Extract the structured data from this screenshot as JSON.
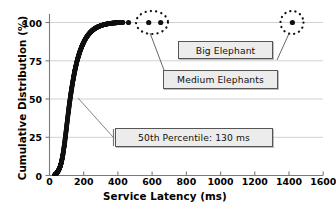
{
  "chart_data": {
    "type": "scatter",
    "title": "",
    "xlabel": "Service Latency (ms)",
    "ylabel": "Cumulative Distribution (%)",
    "xlim": [
      0,
      1600
    ],
    "ylim": [
      0,
      105
    ],
    "xticks": [
      0,
      200,
      400,
      600,
      800,
      1000,
      1200,
      1400,
      1600
    ],
    "yticks": [
      0,
      25,
      50,
      75,
      100
    ],
    "grid": "horizontal",
    "legend": "none",
    "series": [
      {
        "name": "Cumulative distribution of service latency",
        "marker": "filled-circle",
        "color": "#111111",
        "points": [
          [
            30,
            0.3
          ],
          [
            34,
            0.6
          ],
          [
            38,
            1.0
          ],
          [
            42,
            1.5
          ],
          [
            46,
            2.1
          ],
          [
            50,
            2.8
          ],
          [
            54,
            3.6
          ],
          [
            58,
            4.6
          ],
          [
            62,
            5.8
          ],
          [
            66,
            7.2
          ],
          [
            70,
            8.9
          ],
          [
            74,
            11.0
          ],
          [
            78,
            13.4
          ],
          [
            82,
            16.2
          ],
          [
            86,
            19.3
          ],
          [
            90,
            22.7
          ],
          [
            94,
            26.3
          ],
          [
            98,
            30.0
          ],
          [
            102,
            33.8
          ],
          [
            106,
            37.5
          ],
          [
            110,
            41.2
          ],
          [
            114,
            44.7
          ],
          [
            118,
            48.1
          ],
          [
            122,
            51.3
          ],
          [
            126,
            54.3
          ],
          [
            130,
            57.2
          ],
          [
            134,
            59.9
          ],
          [
            138,
            62.5
          ],
          [
            142,
            65.0
          ],
          [
            146,
            67.3
          ],
          [
            150,
            69.5
          ],
          [
            155,
            72.0
          ],
          [
            160,
            74.3
          ],
          [
            165,
            76.4
          ],
          [
            170,
            78.3
          ],
          [
            175,
            80.1
          ],
          [
            180,
            81.7
          ],
          [
            185,
            83.2
          ],
          [
            190,
            84.6
          ],
          [
            195,
            85.9
          ],
          [
            200,
            87.1
          ],
          [
            208,
            88.8
          ],
          [
            216,
            90.3
          ],
          [
            224,
            91.6
          ],
          [
            232,
            92.7
          ],
          [
            240,
            93.7
          ],
          [
            248,
            94.5
          ],
          [
            256,
            95.3
          ],
          [
            264,
            95.9
          ],
          [
            272,
            96.5
          ],
          [
            280,
            97.0
          ],
          [
            290,
            97.5
          ],
          [
            300,
            97.9
          ],
          [
            310,
            98.3
          ],
          [
            320,
            98.6
          ],
          [
            330,
            98.9
          ],
          [
            340,
            99.1
          ],
          [
            350,
            99.3
          ],
          [
            360,
            99.5
          ],
          [
            370,
            99.6
          ],
          [
            380,
            99.7
          ],
          [
            390,
            99.8
          ],
          [
            400,
            99.9
          ],
          [
            412,
            99.9
          ],
          [
            430,
            100.0
          ],
          [
            462,
            100.0
          ],
          [
            580,
            100.0
          ],
          [
            650,
            100.0
          ],
          [
            1420,
            100.0
          ]
        ]
      }
    ],
    "annotations": [
      {
        "id": "big-elephant",
        "label": "Big Elephant",
        "target_point": [
          1420,
          100
        ],
        "marker": "dotted-circle",
        "count": 1
      },
      {
        "id": "medium-elephants",
        "label": "Medium Elephants",
        "target_point": [
          615,
          100
        ],
        "marker": "dotted-ellipse",
        "count": 2
      },
      {
        "id": "p50",
        "label": "50th Percentile: 130 ms",
        "target_point": [
          130,
          50
        ],
        "marker": "leader-line",
        "value": 130,
        "percentile": 50,
        "unit": "ms"
      }
    ]
  },
  "axes": {
    "x": {
      "title": "Service Latency (ms)",
      "ticks": [
        "0",
        "200",
        "400",
        "600",
        "800",
        "1000",
        "1200",
        "1400",
        "1600"
      ]
    },
    "y": {
      "title": "Cumulative Distribution (%)",
      "ticks": [
        "0",
        "25",
        "50",
        "75",
        "100"
      ]
    }
  },
  "annotations": {
    "big_elephant": "Big Elephant",
    "medium_elephants": "Medium Elephants",
    "percentile_50": "50th Percentile: 130 ms"
  },
  "colors": {
    "data": "#111111",
    "axis": "#6f6f6f",
    "grid": "#d2d2d2",
    "box_fill": "#ececec",
    "box_border": "#555555",
    "text": "#000000"
  }
}
